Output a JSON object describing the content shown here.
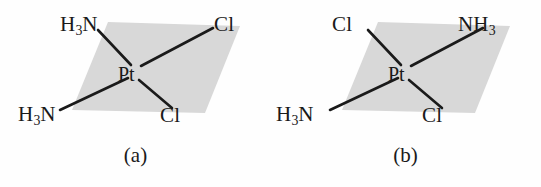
{
  "figure": {
    "background_color": "#fefefe",
    "plane_fill_color": "#d8d8d8",
    "bond_color": "#1a1a1a",
    "label_color": "#1a1a1a"
  },
  "structures": [
    {
      "id": "a",
      "caption": "(a)",
      "center_atom": "Pt",
      "ligands": {
        "top_left": {
          "text": "H3N",
          "base": "H",
          "sub": "3",
          "tail": "N"
        },
        "top_right": {
          "text": "Cl",
          "base": "Cl",
          "sub": "",
          "tail": ""
        },
        "bottom_left": {
          "text": "H3N",
          "base": "H",
          "sub": "3",
          "tail": "N"
        },
        "bottom_right": {
          "text": "Cl",
          "base": "Cl",
          "sub": "",
          "tail": ""
        }
      }
    },
    {
      "id": "b",
      "caption": "(b)",
      "center_atom": "Pt",
      "ligands": {
        "top_left": {
          "text": "Cl",
          "base": "Cl",
          "sub": "",
          "tail": ""
        },
        "top_right": {
          "text": "NH3",
          "base": "NH",
          "sub": "3",
          "tail": ""
        },
        "bottom_left": {
          "text": "H3N",
          "base": "H",
          "sub": "3",
          "tail": "N"
        },
        "bottom_right": {
          "text": "Cl",
          "base": "Cl",
          "sub": "",
          "tail": ""
        }
      }
    }
  ],
  "geometry": {
    "plane_points": "108,22 240,26 205,113 72,110",
    "center_point": {
      "x": 134,
      "y": 72
    },
    "bond_endpoints": {
      "top_left": {
        "x": 98,
        "y": 30
      },
      "top_right": {
        "x": 213,
        "y": 28
      },
      "bottom_left": {
        "x": 60,
        "y": 110
      },
      "bottom_right": {
        "x": 172,
        "y": 108
      }
    }
  }
}
